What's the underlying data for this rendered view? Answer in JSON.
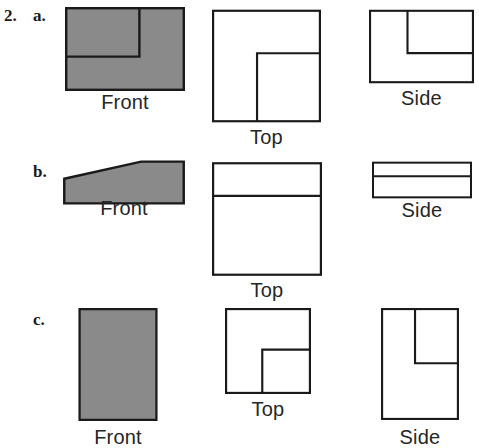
{
  "exercise": {
    "number": "2.",
    "items": [
      "a.",
      "b.",
      "c."
    ]
  },
  "colors": {
    "shaded_fill": "#8a8a8a",
    "outline": "#1a1a1a",
    "background": "#ffffff",
    "text": "#262626"
  },
  "labels": {
    "front": "Front",
    "top": "Top",
    "side": "Side"
  },
  "rows": [
    {
      "id": "a",
      "marker": "a.",
      "views": [
        {
          "name": "front",
          "label": "Front",
          "shaded": true,
          "shape": "rectangle-with-step-line",
          "outline": [
            [
              0,
              0
            ],
            [
              150,
              0
            ],
            [
              150,
              105
            ],
            [
              0,
              105
            ]
          ],
          "inner_lines": [
            [
              [
                0,
                62
              ],
              [
                93,
                62
              ]
            ],
            [
              [
                93,
                62
              ],
              [
                93,
                0
              ]
            ]
          ]
        },
        {
          "name": "top",
          "label": "Top",
          "shaded": false,
          "shape": "square-with-inner-L",
          "outline": [
            [
              0,
              0
            ],
            [
              150,
              0
            ],
            [
              150,
              155
            ],
            [
              0,
              155
            ]
          ],
          "inner_lines": [
            [
              [
                62,
                155
              ],
              [
                62,
                60
              ]
            ],
            [
              [
                62,
                60
              ],
              [
                150,
                60
              ]
            ]
          ]
        },
        {
          "name": "side",
          "label": "Side",
          "shaded": false,
          "shape": "rectangle-with-inner-notch",
          "outline": [
            [
              0,
              0
            ],
            [
              150,
              0
            ],
            [
              150,
              105
            ],
            [
              0,
              105
            ]
          ],
          "inner_lines": [
            [
              [
                55,
                0
              ],
              [
                55,
                62
              ]
            ],
            [
              [
                55,
                62
              ],
              [
                150,
                62
              ]
            ]
          ]
        }
      ]
    },
    {
      "id": "b",
      "marker": "b.",
      "views": [
        {
          "name": "front",
          "label": "Front",
          "shaded": true,
          "shape": "wedge-trapezoid",
          "outline": [
            [
              0,
              22
            ],
            [
              96,
              0
            ],
            [
              150,
              0
            ],
            [
              150,
              55
            ],
            [
              0,
              55
            ]
          ],
          "inner_lines": []
        },
        {
          "name": "top",
          "label": "Top",
          "shaded": false,
          "shape": "rectangle-with-horizontal-divider",
          "outline": [
            [
              0,
              0
            ],
            [
              150,
              0
            ],
            [
              150,
              155
            ],
            [
              0,
              155
            ]
          ],
          "inner_lines": [
            [
              [
                0,
                46
              ],
              [
                150,
                46
              ]
            ]
          ]
        },
        {
          "name": "side",
          "label": "Side",
          "shaded": false,
          "shape": "rectangle-with-horizontal-divider",
          "outline": [
            [
              0,
              0
            ],
            [
              150,
              0
            ],
            [
              150,
              55
            ],
            [
              0,
              55
            ]
          ],
          "inner_lines": [
            [
              [
                0,
                22
              ],
              [
                150,
                22
              ]
            ]
          ]
        }
      ]
    },
    {
      "id": "c",
      "marker": "c.",
      "views": [
        {
          "name": "front",
          "label": "Front",
          "shaded": true,
          "shape": "plain-rectangle",
          "outline": [
            [
              0,
              0
            ],
            [
              105,
              0
            ],
            [
              105,
              150
            ],
            [
              0,
              150
            ]
          ],
          "inner_lines": []
        },
        {
          "name": "top",
          "label": "Top",
          "shaded": false,
          "shape": "square-with-inner-notch",
          "outline": [
            [
              0,
              0
            ],
            [
              120,
              0
            ],
            [
              120,
              120
            ],
            [
              0,
              120
            ]
          ],
          "inner_lines": [
            [
              [
                52,
                120
              ],
              [
                52,
                58
              ]
            ],
            [
              [
                52,
                58
              ],
              [
                120,
                58
              ]
            ]
          ]
        },
        {
          "name": "side",
          "label": "Side",
          "shaded": false,
          "shape": "rectangle-with-inner-notch",
          "outline": [
            [
              0,
              0
            ],
            [
              110,
              0
            ],
            [
              110,
              158
            ],
            [
              0,
              158
            ]
          ],
          "inner_lines": [
            [
              [
                48,
                0
              ],
              [
                48,
                78
              ]
            ],
            [
              [
                48,
                78
              ],
              [
                110,
                78
              ]
            ]
          ]
        }
      ]
    }
  ]
}
